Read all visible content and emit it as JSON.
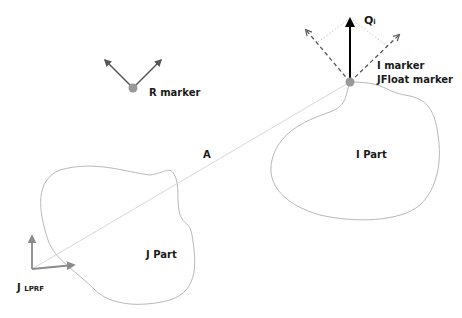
{
  "diagram": {
    "colors": {
      "background": "#ffffff",
      "outline": "#b8b8b8",
      "line_a": "#d8d8d8",
      "marker_dot": "#999999",
      "marker_arrow": "#555555",
      "force_arrow": "#000000",
      "dashed_arrow": "#555555",
      "dotted_guide": "#c8c8c8",
      "frame_arrow": "#8a8a8a",
      "text": "#1a1a1a"
    },
    "labels": {
      "r_marker": "R marker",
      "i_marker": "I marker",
      "jfloat_marker": "JFloat marker",
      "qi_main": "Q",
      "qi_sub": "i",
      "a": "A",
      "i_part": "I Part",
      "j_part": "J Part",
      "j_lprf_main": "J",
      "j_lprf_sub": "LPRF"
    }
  }
}
